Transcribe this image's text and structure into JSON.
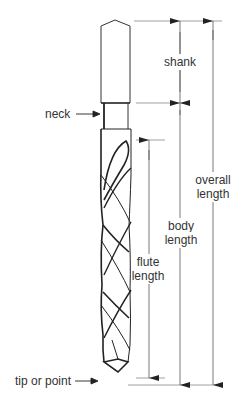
{
  "colors": {
    "line": "#222222",
    "dimension": "#555555",
    "text": "#333333",
    "background": "#ffffff"
  },
  "labels": {
    "shank": "shank",
    "neck": "neck",
    "tip": "tip or point",
    "flute_line1": "flute",
    "flute_line2": "length",
    "body_line1": "body",
    "body_line2": "length",
    "overall_line1": "overall",
    "overall_line2": "length"
  },
  "dimensions": [
    {
      "name": "shank",
      "from": "shank-top",
      "to": "shank-bottom"
    },
    {
      "name": "flute length",
      "from": "flute-start",
      "to": "tip"
    },
    {
      "name": "body length",
      "from": "shank-bottom",
      "to": "tip"
    },
    {
      "name": "overall length",
      "from": "shank-top",
      "to": "tip"
    }
  ],
  "callouts": [
    {
      "name": "neck",
      "points_to": "neck"
    },
    {
      "name": "tip or point",
      "points_to": "tip"
    }
  ]
}
